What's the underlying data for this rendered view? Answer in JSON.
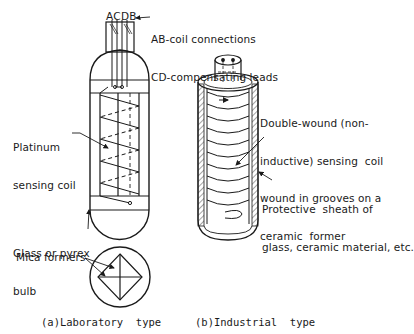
{
  "figure": {
    "lab": {
      "pin_labels": "ACDB",
      "connections_line1": "AB-coil connections",
      "connections_line2": "CD-compensating leads",
      "coil_label_line1": "Platinum",
      "coil_label_line2": "sensing coil",
      "bulb_label_line1": "Glass or pyrex",
      "bulb_label_line2": "bulb",
      "mica_label": "Mica formers",
      "caption": "(a)Laboratory  type"
    },
    "industrial": {
      "coil_label_line1": "Double-wound (non-",
      "coil_label_line2": "inductive) sensing  coil",
      "coil_label_line3": "wound in grooves on a",
      "coil_label_line4": "ceramic  former",
      "sheath_label_line1": "Protective  sheath of",
      "sheath_label_line2": "glass, ceramic material, etc.",
      "caption": "(b)Industrial  type"
    },
    "colors": {
      "ink": "#1a1a1a",
      "background": "#ffffff"
    }
  }
}
